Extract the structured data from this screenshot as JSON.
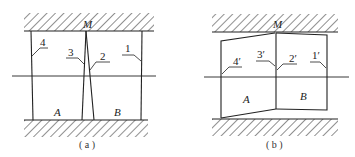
{
  "figure": {
    "panels": [
      {
        "id": "a",
        "caption": "( a )",
        "top_point": "M",
        "regions": [
          "A",
          "B"
        ],
        "lines": [
          "4",
          "3",
          "2",
          "1"
        ]
      },
      {
        "id": "b",
        "caption": "( b )",
        "top_point": "M",
        "regions": [
          "A",
          "B"
        ],
        "lines": [
          "4′",
          "3′",
          "2′",
          "1′"
        ]
      }
    ],
    "colors": {
      "line": "#222222",
      "hatch": "#333333",
      "background": "#ffffff"
    }
  }
}
